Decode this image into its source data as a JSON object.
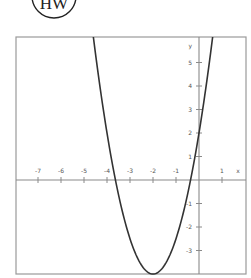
{
  "logo": {
    "text": "HW",
    "cx": 54,
    "cy": -4,
    "r": 22
  },
  "frame": {
    "x": 16,
    "y": 37,
    "width": 230,
    "height": 237
  },
  "chart_data": {
    "type": "line",
    "title": "",
    "xlabel": "x",
    "ylabel": "y",
    "function": "y = 1.5(x + 2)^2 - 4",
    "vertex": [
      -2,
      -4
    ],
    "y_intercept": 2,
    "x_intercepts": [
      -3.63,
      -0.37
    ],
    "xlim": [
      -8,
      2
    ],
    "ylim": [
      -4,
      6.1
    ],
    "x_ticks": [
      -7,
      -6,
      -5,
      -4,
      -3,
      -2,
      -1,
      1
    ],
    "y_ticks": [
      5,
      4,
      3,
      2,
      1,
      -1,
      -2,
      -3
    ],
    "x_tick_labels": [
      "-7",
      "-6",
      "-5",
      "-4",
      "-3",
      "-2",
      "-1",
      "1"
    ],
    "y_tick_labels": [
      "5",
      "4",
      "3",
      "2",
      "1",
      "-1",
      "-2",
      "-3"
    ],
    "grid": false,
    "legend": null,
    "series": [
      {
        "name": "parabola",
        "x": [
          -4.59,
          -4.5,
          -4.0,
          -3.5,
          -3.0,
          -2.5,
          -2.0,
          -1.5,
          -1.0,
          -0.5,
          0.0,
          0.5,
          0.59
        ],
        "y": [
          6.06,
          5.38,
          2.0,
          -0.63,
          -2.5,
          -3.63,
          -4.0,
          -3.63,
          -2.5,
          -0.63,
          2.0,
          5.38,
          6.06
        ]
      }
    ]
  },
  "axes": {
    "origin_px": [
      199,
      180
    ],
    "x_unit_px": 23,
    "y_unit_px": 23.5,
    "colors": {
      "axis": "#8a8a8a",
      "frame": "#9a9a9a",
      "curve": "#333333",
      "text": "#555555"
    }
  }
}
